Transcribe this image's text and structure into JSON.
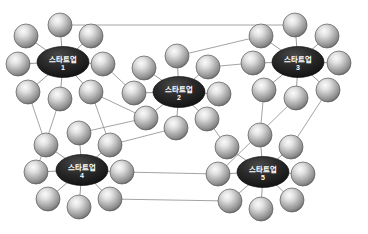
{
  "diagram": {
    "type": "network-cluster-diagram",
    "background_color": "#ffffff",
    "link_color": "#8d8d8d",
    "hub_fill_dark": "#1c1c1c",
    "hub_fill_mid": "#3a3a3a",
    "hub_text_color": "#ffffff",
    "node_light": "#f2f2f2",
    "node_mid": "#b6b6b6",
    "node_dark": "#6f6f6f",
    "node_edge": "#5a5a5a",
    "hubs": [
      {
        "id": "hub1",
        "name": "스타트업",
        "number": "1",
        "cx": 63,
        "cy": 62,
        "rx": 26,
        "ry": 15.5
      },
      {
        "id": "hub2",
        "name": "스타트업",
        "number": "2",
        "cx": 179,
        "cy": 92,
        "rx": 26,
        "ry": 15.5
      },
      {
        "id": "hub3",
        "name": "스타트업",
        "number": "3",
        "cx": 298,
        "cy": 62,
        "rx": 26,
        "ry": 15.5
      },
      {
        "id": "hub4",
        "name": "스타트업",
        "number": "4",
        "cx": 82,
        "cy": 170,
        "rx": 26,
        "ry": 15.5
      },
      {
        "id": "hub5",
        "name": "스타트업",
        "number": "5",
        "cx": 263,
        "cy": 172,
        "rx": 26,
        "ry": 15.5
      }
    ],
    "satellites": [
      {
        "id": "h1s1",
        "hub": "hub1",
        "cx": 26,
        "cy": 36,
        "r": 12
      },
      {
        "id": "h1s2",
        "hub": "hub1",
        "cx": 60,
        "cy": 25,
        "r": 12
      },
      {
        "id": "h1s3",
        "hub": "hub1",
        "cx": 91,
        "cy": 36,
        "r": 12
      },
      {
        "id": "h1s4",
        "hub": "hub1",
        "cx": 103,
        "cy": 64,
        "r": 12
      },
      {
        "id": "h1s5",
        "hub": "hub1",
        "cx": 91,
        "cy": 92,
        "r": 12
      },
      {
        "id": "h1s6",
        "hub": "hub1",
        "cx": 60,
        "cy": 99,
        "r": 12
      },
      {
        "id": "h1s7",
        "hub": "hub1",
        "cx": 28,
        "cy": 92,
        "r": 12
      },
      {
        "id": "h1s8",
        "hub": "hub1",
        "cx": 18,
        "cy": 64,
        "r": 12
      },
      {
        "id": "h2s1",
        "hub": "hub2",
        "cx": 144,
        "cy": 68,
        "r": 12
      },
      {
        "id": "h2s2",
        "hub": "hub2",
        "cx": 177,
        "cy": 56,
        "r": 12
      },
      {
        "id": "h2s3",
        "hub": "hub2",
        "cx": 208,
        "cy": 67,
        "r": 12
      },
      {
        "id": "h2s4",
        "hub": "hub2",
        "cx": 219,
        "cy": 94,
        "r": 12
      },
      {
        "id": "h2s5",
        "hub": "hub2",
        "cx": 207,
        "cy": 119,
        "r": 12
      },
      {
        "id": "h2s6",
        "hub": "hub2",
        "cx": 176,
        "cy": 128,
        "r": 12
      },
      {
        "id": "h2s7",
        "hub": "hub2",
        "cx": 146,
        "cy": 118,
        "r": 12
      },
      {
        "id": "h2s8",
        "hub": "hub2",
        "cx": 134,
        "cy": 93,
        "r": 12
      },
      {
        "id": "h3s1",
        "hub": "hub3",
        "cx": 261,
        "cy": 36,
        "r": 12
      },
      {
        "id": "h3s2",
        "hub": "hub3",
        "cx": 295,
        "cy": 25,
        "r": 12
      },
      {
        "id": "h3s3",
        "hub": "hub3",
        "cx": 327,
        "cy": 36,
        "r": 12
      },
      {
        "id": "h3s4",
        "hub": "hub3",
        "cx": 339,
        "cy": 63,
        "r": 12
      },
      {
        "id": "h3s5",
        "hub": "hub3",
        "cx": 328,
        "cy": 90,
        "r": 12
      },
      {
        "id": "h3s6",
        "hub": "hub3",
        "cx": 296,
        "cy": 98,
        "r": 12
      },
      {
        "id": "h3s7",
        "hub": "hub3",
        "cx": 264,
        "cy": 90,
        "r": 12
      },
      {
        "id": "h3s8",
        "hub": "hub3",
        "cx": 253,
        "cy": 63,
        "r": 12
      },
      {
        "id": "h4s1",
        "hub": "hub4",
        "cx": 46,
        "cy": 145,
        "r": 12
      },
      {
        "id": "h4s2",
        "hub": "hub4",
        "cx": 79,
        "cy": 133,
        "r": 12
      },
      {
        "id": "h4s3",
        "hub": "hub4",
        "cx": 110,
        "cy": 145,
        "r": 12
      },
      {
        "id": "h4s4",
        "hub": "hub4",
        "cx": 122,
        "cy": 172,
        "r": 12
      },
      {
        "id": "h4s5",
        "hub": "hub4",
        "cx": 110,
        "cy": 199,
        "r": 12
      },
      {
        "id": "h4s6",
        "hub": "hub4",
        "cx": 79,
        "cy": 207,
        "r": 12
      },
      {
        "id": "h4s7",
        "hub": "hub4",
        "cx": 48,
        "cy": 199,
        "r": 12
      },
      {
        "id": "h4s8",
        "hub": "hub4",
        "cx": 36,
        "cy": 172,
        "r": 12
      },
      {
        "id": "h5s1",
        "hub": "hub5",
        "cx": 227,
        "cy": 147,
        "r": 12
      },
      {
        "id": "h5s2",
        "hub": "hub5",
        "cx": 260,
        "cy": 135,
        "r": 12
      },
      {
        "id": "h5s3",
        "hub": "hub5",
        "cx": 291,
        "cy": 147,
        "r": 12
      },
      {
        "id": "h5s4",
        "hub": "hub5",
        "cx": 303,
        "cy": 174,
        "r": 12
      },
      {
        "id": "h5s5",
        "hub": "hub5",
        "cx": 292,
        "cy": 200,
        "r": 12
      },
      {
        "id": "h5s6",
        "hub": "hub5",
        "cx": 261,
        "cy": 209,
        "r": 12
      },
      {
        "id": "h5s7",
        "hub": "hub5",
        "cx": 230,
        "cy": 201,
        "r": 12
      },
      {
        "id": "h5s8",
        "hub": "hub5",
        "cx": 218,
        "cy": 174,
        "r": 12
      }
    ],
    "spokes": [
      [
        "hub1",
        "h1s1"
      ],
      [
        "hub1",
        "h1s2"
      ],
      [
        "hub1",
        "h1s3"
      ],
      [
        "hub1",
        "h1s4"
      ],
      [
        "hub1",
        "h1s5"
      ],
      [
        "hub1",
        "h1s6"
      ],
      [
        "hub1",
        "h1s7"
      ],
      [
        "hub1",
        "h1s8"
      ],
      [
        "hub2",
        "h2s1"
      ],
      [
        "hub2",
        "h2s2"
      ],
      [
        "hub2",
        "h2s3"
      ],
      [
        "hub2",
        "h2s4"
      ],
      [
        "hub2",
        "h2s5"
      ],
      [
        "hub2",
        "h2s6"
      ],
      [
        "hub2",
        "h2s7"
      ],
      [
        "hub2",
        "h2s8"
      ],
      [
        "hub3",
        "h3s1"
      ],
      [
        "hub3",
        "h3s2"
      ],
      [
        "hub3",
        "h3s3"
      ],
      [
        "hub3",
        "h3s4"
      ],
      [
        "hub3",
        "h3s5"
      ],
      [
        "hub3",
        "h3s6"
      ],
      [
        "hub3",
        "h3s7"
      ],
      [
        "hub3",
        "h3s8"
      ],
      [
        "hub4",
        "h4s1"
      ],
      [
        "hub4",
        "h4s2"
      ],
      [
        "hub4",
        "h4s3"
      ],
      [
        "hub4",
        "h4s4"
      ],
      [
        "hub4",
        "h4s5"
      ],
      [
        "hub4",
        "h4s6"
      ],
      [
        "hub4",
        "h4s7"
      ],
      [
        "hub4",
        "h4s8"
      ],
      [
        "hub5",
        "h5s1"
      ],
      [
        "hub5",
        "h5s2"
      ],
      [
        "hub5",
        "h5s3"
      ],
      [
        "hub5",
        "h5s4"
      ],
      [
        "hub5",
        "h5s5"
      ],
      [
        "hub5",
        "h5s6"
      ],
      [
        "hub5",
        "h5s7"
      ],
      [
        "hub5",
        "h5s8"
      ]
    ],
    "inter_links": [
      [
        "h1s2",
        "h3s2"
      ],
      [
        "h1s4",
        "h2s8"
      ],
      [
        "h1s5",
        "h2s7"
      ],
      [
        "h2s2",
        "h3s1"
      ],
      [
        "h2s3",
        "h3s8"
      ],
      [
        "h2s5",
        "h5s1"
      ],
      [
        "h1s7",
        "h4s1"
      ],
      [
        "h1s5",
        "h4s3"
      ],
      [
        "h3s7",
        "h5s2"
      ],
      [
        "h3s6",
        "h5s8"
      ],
      [
        "h2s6",
        "h4s3"
      ],
      [
        "h4s4",
        "h5s8"
      ],
      [
        "h4s5",
        "h5s7"
      ],
      [
        "h1s6",
        "h4s8"
      ],
      [
        "h2s7",
        "h4s2"
      ],
      [
        "h3s5",
        "h5s3"
      ]
    ]
  }
}
